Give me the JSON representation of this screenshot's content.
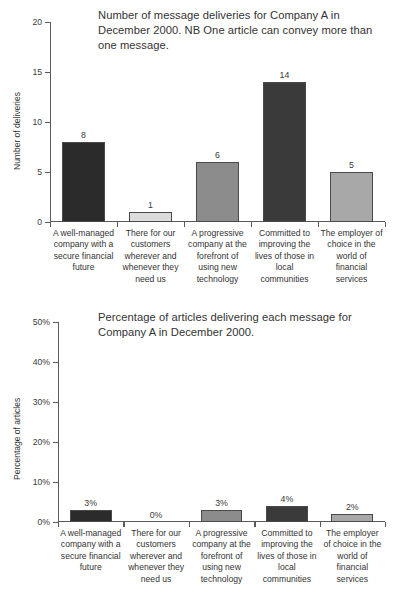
{
  "chart_data": [
    {
      "id": "deliveries",
      "type": "bar",
      "title": "Number of message deliveries for Company A in December 2000. NB One article can convey more than one message.",
      "xlabel": "",
      "ylabel": "Number of deliveries",
      "ylim": [
        0,
        20
      ],
      "yticks": [
        0,
        5,
        10,
        15,
        20
      ],
      "ytick_labels": [
        "0",
        "5",
        "10",
        "15",
        "20"
      ],
      "grid": false,
      "legend": "none",
      "categories": [
        "A well-managed company with a secure financial future",
        "There for our customers wherever and whenever they need us",
        "A progressive company at the forefront of using new technology",
        "Committed to improving the lives of those in local communities",
        "The employer of choice in the world of financial services"
      ],
      "values": [
        8,
        1,
        6,
        14,
        5
      ],
      "value_labels": [
        "8",
        "1",
        "6",
        "14",
        "5"
      ],
      "bar_colors": [
        "#2b2b2b",
        "#dcdcdc",
        "#8c8c8c",
        "#3a3a3a",
        "#a8a8a8"
      ]
    },
    {
      "id": "percentage",
      "type": "bar",
      "title": "Percentage of articles delivering each message for Company A in December 2000.",
      "xlabel": "",
      "ylabel": "Percentage of articles",
      "ylim": [
        0,
        50
      ],
      "yticks": [
        0,
        10,
        20,
        30,
        40,
        50
      ],
      "ytick_labels": [
        "0%",
        "10%",
        "20%",
        "30%",
        "40%",
        "50%"
      ],
      "grid": false,
      "legend": "none",
      "categories": [
        "A well-managed company with a secure financial future",
        "There for our customers wherever and whenever they need us",
        "A progressive company at the forefront of using new technology",
        "Committed to improving the lives of those in local communities",
        "The employer of choice in the world of financial services"
      ],
      "values": [
        3,
        0,
        3,
        4,
        2
      ],
      "value_labels": [
        "3%",
        "0%",
        "3%",
        "4%",
        "2%"
      ],
      "bar_colors": [
        "#2b2b2b",
        "#dcdcdc",
        "#8c8c8c",
        "#3a3a3a",
        "#a8a8a8"
      ]
    }
  ],
  "theme": {
    "background": "#ffffff",
    "axis_color": "#5a5a5a",
    "text_color": "#333333"
  }
}
